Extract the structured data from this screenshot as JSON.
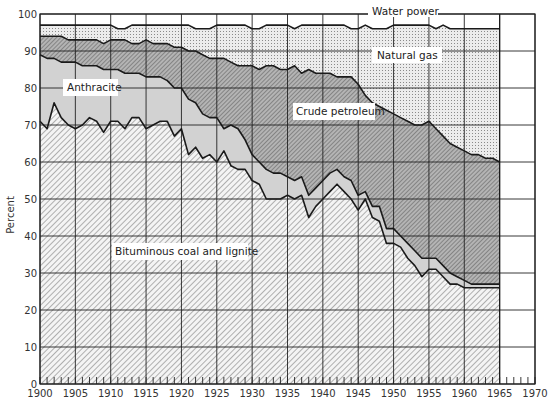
{
  "chart_data": {
    "type": "area",
    "stacked": true,
    "title": "",
    "xlabel": "",
    "ylabel": "Percent",
    "xlim": [
      1900,
      1970
    ],
    "ylim": [
      0,
      100
    ],
    "x_ticks": [
      1900,
      1905,
      1910,
      1915,
      1920,
      1925,
      1930,
      1935,
      1940,
      1945,
      1950,
      1955,
      1960,
      1965,
      1970
    ],
    "y_ticks": [
      0,
      10,
      20,
      30,
      40,
      50,
      60,
      70,
      80,
      90,
      100
    ],
    "grid": true,
    "legend_position": "inline labels",
    "x": [
      1900,
      1901,
      1902,
      1903,
      1904,
      1905,
      1906,
      1907,
      1908,
      1909,
      1910,
      1911,
      1912,
      1913,
      1914,
      1915,
      1916,
      1917,
      1918,
      1919,
      1920,
      1921,
      1922,
      1923,
      1924,
      1925,
      1926,
      1927,
      1928,
      1929,
      1930,
      1931,
      1932,
      1933,
      1934,
      1935,
      1936,
      1937,
      1938,
      1939,
      1940,
      1941,
      1942,
      1943,
      1944,
      1945,
      1946,
      1947,
      1948,
      1949,
      1950,
      1951,
      1952,
      1953,
      1954,
      1955,
      1956,
      1957,
      1958,
      1959,
      1960,
      1961,
      1962,
      1963,
      1964,
      1965
    ],
    "cumulative_boundaries": {
      "bituminous_top": [
        71,
        69,
        76,
        72,
        70,
        69,
        70,
        72,
        71,
        68,
        71,
        71,
        69,
        72,
        72,
        69,
        70,
        71,
        71,
        67,
        69,
        62,
        64,
        61,
        62,
        60,
        63,
        59,
        58,
        58,
        55,
        54,
        50,
        50,
        50,
        51,
        50,
        51,
        45,
        48,
        50,
        52,
        54,
        52,
        50,
        47,
        50,
        45,
        44,
        38,
        38,
        37,
        34,
        32,
        29,
        31,
        31,
        29,
        27,
        27,
        26,
        26,
        26,
        26,
        26,
        26
      ],
      "anthracite_top": [
        89,
        88,
        88,
        87,
        87,
        87,
        86,
        86,
        86,
        85,
        85,
        85,
        84,
        84,
        84,
        83,
        83,
        83,
        82,
        80,
        80,
        77,
        76,
        73,
        72,
        72,
        69,
        70,
        69,
        66,
        62,
        60,
        58,
        57,
        57,
        56,
        55,
        56,
        51,
        53,
        55,
        57,
        58,
        56,
        55,
        51,
        52,
        48,
        48,
        42,
        42,
        40,
        38,
        36,
        34,
        34,
        34,
        32,
        30,
        29,
        28,
        27,
        27,
        27,
        27,
        27
      ],
      "petroleum_top": [
        94,
        94,
        94,
        94,
        93,
        93,
        93,
        93,
        93,
        92,
        93,
        93,
        93,
        92,
        92,
        93,
        92,
        92,
        92,
        91,
        91,
        90,
        90,
        89,
        88,
        88,
        88,
        87,
        86,
        86,
        86,
        85,
        86,
        86,
        85,
        85,
        86,
        84,
        85,
        84,
        84,
        84,
        83,
        83,
        83,
        81,
        78,
        76,
        75,
        74,
        73,
        72,
        71,
        70,
        70,
        71,
        69,
        67,
        65,
        64,
        63,
        62,
        62,
        61,
        61,
        60
      ],
      "natural_gas_top": [
        97,
        97,
        97,
        97,
        97,
        97,
        97,
        97,
        97,
        97,
        97,
        96,
        96,
        97,
        97,
        97,
        97,
        97,
        97,
        97,
        97,
        97,
        96,
        96,
        96,
        97,
        97,
        97,
        97,
        97,
        96,
        96,
        97,
        97,
        97,
        97,
        96,
        97,
        97,
        97,
        97,
        97,
        97,
        97,
        96,
        96,
        97,
        96,
        96,
        96,
        97,
        97,
        97,
        97,
        97,
        97,
        96,
        97,
        96,
        96,
        96,
        96,
        96,
        96,
        96,
        96
      ],
      "water_power_top": [
        100,
        100,
        100,
        100,
        100,
        100,
        100,
        100,
        100,
        100,
        100,
        100,
        100,
        100,
        100,
        100,
        100,
        100,
        100,
        100,
        100,
        100,
        100,
        100,
        100,
        100,
        100,
        100,
        100,
        100,
        100,
        100,
        100,
        100,
        100,
        100,
        100,
        100,
        100,
        100,
        100,
        100,
        100,
        100,
        100,
        100,
        100,
        100,
        100,
        100,
        100,
        100,
        100,
        100,
        100,
        100,
        100,
        100,
        100,
        100,
        100,
        100,
        100,
        100,
        100,
        100
      ]
    },
    "series": [
      {
        "name": "Bituminous coal and lignite",
        "pattern": "light diagonal hatch"
      },
      {
        "name": "Anthracite",
        "pattern": "light gray"
      },
      {
        "name": "Crude petroleum",
        "pattern": "dark diagonal hatch"
      },
      {
        "name": "Natural gas",
        "pattern": "stipple dots"
      },
      {
        "name": "Water power",
        "pattern": "white"
      }
    ],
    "annotations": [
      "Water power",
      "Natural gas",
      "Anthracite",
      "Crude petroleum",
      "Bituminous coal and lignite"
    ]
  },
  "labels": {
    "ylabel": "Percent",
    "water": "Water power",
    "gas": "Natural gas",
    "anthracite": "Anthracite",
    "petroleum": "Crude petroleum",
    "bituminous": "Bituminous coal and lignite"
  },
  "colors": {
    "bituminous_fill": "#f4f4f4",
    "bituminous_hatch": "#6a6a6a",
    "anthracite_fill": "#d2d2d2",
    "petroleum_fill": "#b4b4b4",
    "petroleum_hatch": "#555555",
    "gas_fill": "#ececec",
    "gas_dot": "#8a8a8a",
    "water_fill": "#ffffff",
    "line": "#1a1a1a",
    "grid": "#222222"
  }
}
